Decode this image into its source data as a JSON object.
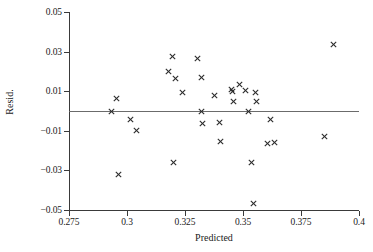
{
  "chart_data": {
    "type": "scatter",
    "title": "",
    "xlabel": "Predicted",
    "ylabel": "Resid.",
    "xlim": [
      0.275,
      0.4
    ],
    "ylim": [
      -0.05,
      0.05
    ],
    "xticks": [
      0.275,
      0.3,
      0.325,
      0.35,
      0.375,
      0.4
    ],
    "xtick_labels": [
      "0.275",
      "0.3",
      "0.325",
      "0.35",
      "0.375",
      "0.4"
    ],
    "yticks": [
      0.05,
      0.03,
      0.01,
      -0.01,
      -0.03,
      -0.05
    ],
    "ytick_labels": [
      "0.05",
      "0.03",
      "0.01",
      "−0.01",
      "−0.03",
      "−0.05"
    ],
    "grid": false,
    "legend": null,
    "marker": "x",
    "marker_color": "#2b2b2b",
    "reference_line": {
      "orientation": "horizontal",
      "y": 0.0,
      "color": "#6b6b6b"
    },
    "points": [
      {
        "x": 0.2935,
        "y": 0.0
      },
      {
        "x": 0.2955,
        "y": 0.0063
      },
      {
        "x": 0.2965,
        "y": -0.0322
      },
      {
        "x": 0.3015,
        "y": -0.0041
      },
      {
        "x": 0.304,
        "y": -0.0096
      },
      {
        "x": 0.318,
        "y": 0.02
      },
      {
        "x": 0.3195,
        "y": 0.0274
      },
      {
        "x": 0.32,
        "y": -0.0262
      },
      {
        "x": 0.321,
        "y": 0.0163
      },
      {
        "x": 0.324,
        "y": 0.0091
      },
      {
        "x": 0.3305,
        "y": 0.0266
      },
      {
        "x": 0.332,
        "y": 0.0
      },
      {
        "x": 0.332,
        "y": 0.0168
      },
      {
        "x": 0.3325,
        "y": -0.0064
      },
      {
        "x": 0.3375,
        "y": 0.0077
      },
      {
        "x": 0.34,
        "y": -0.0057
      },
      {
        "x": 0.3405,
        "y": -0.0156
      },
      {
        "x": 0.345,
        "y": 0.011
      },
      {
        "x": 0.3455,
        "y": 0.0096
      },
      {
        "x": 0.346,
        "y": 0.0046
      },
      {
        "x": 0.3485,
        "y": 0.0133
      },
      {
        "x": 0.351,
        "y": 0.0103
      },
      {
        "x": 0.3525,
        "y": 0.0
      },
      {
        "x": 0.3535,
        "y": -0.0259
      },
      {
        "x": 0.3545,
        "y": -0.0469
      },
      {
        "x": 0.3555,
        "y": 0.0095
      },
      {
        "x": 0.356,
        "y": 0.005
      },
      {
        "x": 0.3605,
        "y": -0.0165
      },
      {
        "x": 0.362,
        "y": -0.0042
      },
      {
        "x": 0.3635,
        "y": -0.0157
      },
      {
        "x": 0.385,
        "y": -0.0131
      },
      {
        "x": 0.389,
        "y": 0.0335
      }
    ],
    "n_points": 32
  }
}
